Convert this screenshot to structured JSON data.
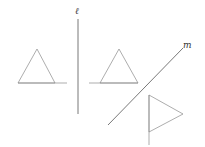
{
  "labels": {
    "line_l": "ℓ",
    "line_m": "m"
  },
  "colors": {
    "stroke": "#8a8a8a",
    "axis": "#555555"
  },
  "figures": [
    {
      "name": "original-triangle",
      "points": "37,49 18,83 55,83"
    },
    {
      "name": "reflected-triangle-over-l",
      "points": "119,49 100,83 138,83"
    },
    {
      "name": "reflected-triangle-over-m",
      "points": "149,95 183,114 149,132"
    }
  ]
}
